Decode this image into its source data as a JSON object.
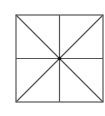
{
  "diagram": {
    "type": "square-with-diagonals-and-midlines",
    "square": {
      "x": 16,
      "y": 15,
      "size": 87
    },
    "center": {
      "x": 59.5,
      "y": 58.5
    },
    "stroke_color": "#555555",
    "dot_color": "#111111",
    "stroke_width": 1.2,
    "dot_radius": 1.8
  }
}
